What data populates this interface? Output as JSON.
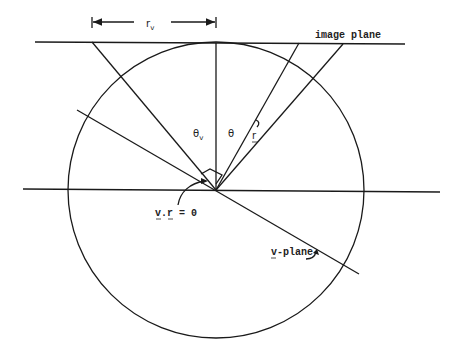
{
  "diagram": {
    "labels": {
      "r_v": "r",
      "r_v_sub": "v",
      "image_plane": "image plane",
      "theta_v": "θ",
      "theta_v_sub": "v",
      "theta": "θ",
      "r_vector": "r",
      "v_dot_r": "v.r = 0",
      "v_plane": "v-plane"
    },
    "elements": [
      "circle",
      "image-plane-line",
      "horizontal-axis",
      "vertical-axis",
      "view-ray-left",
      "view-ray-theta",
      "view-ray-right",
      "v-plane-line",
      "r_v-dimension-arrow",
      "right-angle-marker"
    ]
  }
}
